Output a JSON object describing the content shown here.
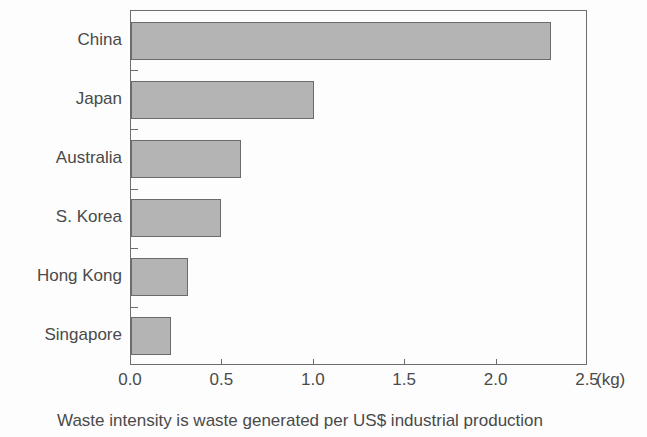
{
  "chart_data": {
    "type": "bar",
    "orientation": "horizontal",
    "categories": [
      "China",
      "Japan",
      "Australia",
      "S. Korea",
      "Hong Kong",
      "Singapore"
    ],
    "values": [
      2.3,
      1.0,
      0.6,
      0.49,
      0.31,
      0.22
    ],
    "title": "",
    "xlabel": "",
    "ylabel": "",
    "unit_label": "(kg)",
    "xlim": [
      0.0,
      2.5
    ],
    "xticks": [
      0.0,
      0.5,
      1.0,
      1.5,
      2.0,
      2.5
    ],
    "xtick_labels": [
      "0.0",
      "0.5",
      "1.0",
      "1.5",
      "2.0",
      "2.5"
    ],
    "grid": false,
    "legend": null,
    "caption": "Waste intensity is waste generated per US$ industrial production",
    "bar_fill_color": "#b4b4b4",
    "bar_border_color": "#6b6b6b",
    "axis_color": "#6e6e6e",
    "background_color": "#fdfdfd",
    "text_color": "#4a4a4a"
  }
}
